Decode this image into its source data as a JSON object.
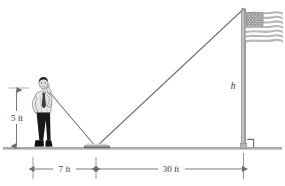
{
  "figure": {
    "ground_label": "",
    "labels": {
      "person_height": "5 ft",
      "person_to_mirror": "7 ft",
      "mirror_to_pole": "30 ft",
      "pole_height": "h"
    },
    "objects": {
      "person": "man-standing-figure",
      "mirror": "mirror-on-ground",
      "flagpole": "flagpole",
      "flag": "american-flag",
      "right_angle": "right-angle-marker"
    },
    "colors": {
      "line": "#6b6b6b",
      "ground": "#9a9a9a",
      "text": "#3c3c3c",
      "flag_red": "#b9b9b9",
      "flag_blue": "#8a8a8a",
      "shirt": "#e8e8e8",
      "pants": "#1a1a1a",
      "background": "#ffffff"
    },
    "geometry": {
      "ground_y": 148,
      "person_x": 44,
      "mirror_x": 96,
      "pole_x": 243,
      "pole_top_y": 10,
      "eye_y": 88
    }
  }
}
